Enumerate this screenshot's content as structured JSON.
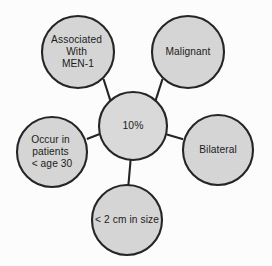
{
  "diagram": {
    "type": "radial-hub-and-spoke",
    "title": "",
    "background_color": "#fdfdfd",
    "node_fill_color": "#d6d6d6",
    "node_stroke_color": "#252525",
    "text_color": "#1c1c1c",
    "center_node": {
      "id": "center",
      "label": "10%",
      "lines": [
        "10%"
      ],
      "cx": 133,
      "cy": 126,
      "r": 34
    },
    "outer_nodes": [
      {
        "id": "associated-with-men-1",
        "label": "Associated With MEN-1",
        "lines": [
          "Associated",
          "With",
          "MEN-1"
        ],
        "cx": 78,
        "cy": 52,
        "r": 36
      },
      {
        "id": "malignant",
        "label": "Malignant",
        "lines": [
          "Malignant"
        ],
        "cx": 188,
        "cy": 52,
        "r": 36
      },
      {
        "id": "bilateral",
        "label": "Bilateral",
        "lines": [
          "Bilateral"
        ],
        "cx": 218,
        "cy": 150,
        "r": 35
      },
      {
        "id": "less-than-2-cm-in-size",
        "label": "< 2 cm in size",
        "lines": [
          "< 2 cm in size"
        ],
        "cx": 127,
        "cy": 220,
        "r": 35
      },
      {
        "id": "occur-in-patients-under-age-30",
        "label": "Occur in patients < age 30",
        "lines": [
          "Occur in",
          "patients",
          "< age 30"
        ],
        "cx": 52,
        "cy": 152,
        "r": 35
      }
    ],
    "connectors": [
      {
        "id": "center-to-associated-with-men-1",
        "x1": 110.9,
        "y1": 102.1,
        "x2": 103.5,
        "y2": 79.0
      },
      {
        "id": "center-to-malignant",
        "x1": 155.1,
        "y1": 102.1,
        "x2": 162.5,
        "y2": 79.0
      },
      {
        "id": "center-to-bilateral",
        "x1": 166.9,
        "y1": 134.5,
        "x2": 183.2,
        "y2": 139.3
      },
      {
        "id": "center-to-less-than-2-cm",
        "x1": 130.6,
        "y1": 160.0,
        "x2": 128.4,
        "y2": 185.0
      },
      {
        "id": "center-to-occur-in-patients",
        "x1": 99.1,
        "y1": 134.2,
        "x2": 86.9,
        "y2": 139.0
      }
    ]
  }
}
